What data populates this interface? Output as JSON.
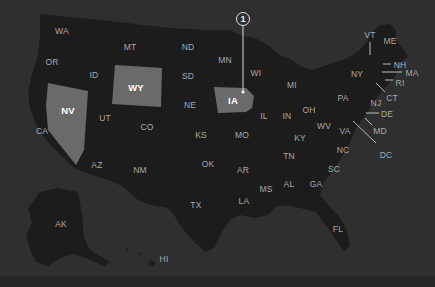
{
  "colors": {
    "background": "#2f2f2f",
    "state_fill": "#1c1c1c",
    "highlight_fill": "#6a6a6a",
    "label": "#a9a9a9",
    "highlight_label": "#ffffff",
    "leader_line": "#bdbdbd"
  },
  "highlighted_states": [
    "NV",
    "WY",
    "IA"
  ],
  "marker": {
    "number": "1",
    "state": "IA",
    "x": 243,
    "y": 19
  },
  "states": [
    {
      "code": "WA",
      "x": 62,
      "y": 31
    },
    {
      "code": "OR",
      "x": 52,
      "y": 62
    },
    {
      "code": "ID",
      "x": 94,
      "y": 75
    },
    {
      "code": "MT",
      "x": 130,
      "y": 47
    },
    {
      "code": "ND",
      "x": 188,
      "y": 47
    },
    {
      "code": "SD",
      "x": 188,
      "y": 76
    },
    {
      "code": "WY",
      "x": 136,
      "y": 87
    },
    {
      "code": "NV",
      "x": 68,
      "y": 110
    },
    {
      "code": "UT",
      "x": 105,
      "y": 118
    },
    {
      "code": "CA",
      "x": 42,
      "y": 131
    },
    {
      "code": "CO",
      "x": 147,
      "y": 127
    },
    {
      "code": "NE",
      "x": 190,
      "y": 105
    },
    {
      "code": "KS",
      "x": 201,
      "y": 135
    },
    {
      "code": "AZ",
      "x": 97,
      "y": 165
    },
    {
      "code": "NM",
      "x": 140,
      "y": 170
    },
    {
      "code": "OK",
      "x": 208,
      "y": 164
    },
    {
      "code": "TX",
      "x": 196,
      "y": 205
    },
    {
      "code": "MN",
      "x": 225,
      "y": 60
    },
    {
      "code": "IA",
      "x": 233,
      "y": 100
    },
    {
      "code": "WI",
      "x": 256,
      "y": 73
    },
    {
      "code": "MO",
      "x": 242,
      "y": 135
    },
    {
      "code": "AR",
      "x": 243,
      "y": 170
    },
    {
      "code": "LA",
      "x": 244,
      "y": 201
    },
    {
      "code": "MS",
      "x": 266,
      "y": 189
    },
    {
      "code": "IL",
      "x": 264,
      "y": 116
    },
    {
      "code": "IN",
      "x": 287,
      "y": 116
    },
    {
      "code": "MI",
      "x": 292,
      "y": 85
    },
    {
      "code": "OH",
      "x": 309,
      "y": 110
    },
    {
      "code": "KY",
      "x": 300,
      "y": 138
    },
    {
      "code": "TN",
      "x": 289,
      "y": 156
    },
    {
      "code": "AL",
      "x": 289,
      "y": 184
    },
    {
      "code": "GA",
      "x": 316,
      "y": 184
    },
    {
      "code": "WV",
      "x": 324,
      "y": 126
    },
    {
      "code": "VA",
      "x": 345,
      "y": 131
    },
    {
      "code": "PA",
      "x": 343,
      "y": 98
    },
    {
      "code": "NY",
      "x": 357,
      "y": 74
    },
    {
      "code": "NC",
      "x": 343,
      "y": 150
    },
    {
      "code": "SC",
      "x": 334,
      "y": 169
    },
    {
      "code": "FL",
      "x": 338,
      "y": 229
    },
    {
      "code": "VT",
      "x": 370,
      "y": 35
    },
    {
      "code": "ME",
      "x": 390,
      "y": 41
    },
    {
      "code": "NH",
      "x": 400,
      "y": 65
    },
    {
      "code": "MA",
      "x": 412,
      "y": 73
    },
    {
      "code": "RI",
      "x": 400,
      "y": 83
    },
    {
      "code": "CT",
      "x": 392,
      "y": 98
    },
    {
      "code": "NJ",
      "x": 376,
      "y": 103
    },
    {
      "code": "DE",
      "x": 387,
      "y": 114
    },
    {
      "code": "MD",
      "x": 380,
      "y": 131
    },
    {
      "code": "DC",
      "x": 386,
      "y": 155
    },
    {
      "code": "AK",
      "x": 61,
      "y": 224
    },
    {
      "code": "HI",
      "x": 164,
      "y": 259
    }
  ]
}
